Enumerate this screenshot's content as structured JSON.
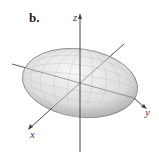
{
  "figure": {
    "panel_label": "b.",
    "shape": "ellipsoid",
    "axes": {
      "z_label": "z",
      "y_label": "y",
      "x_label": "x"
    },
    "colors": {
      "surface_light": "#f2f2f2",
      "surface_dark": "#9a9a9a",
      "axis": "#444444",
      "mesh": "#bdbdbd"
    }
  }
}
